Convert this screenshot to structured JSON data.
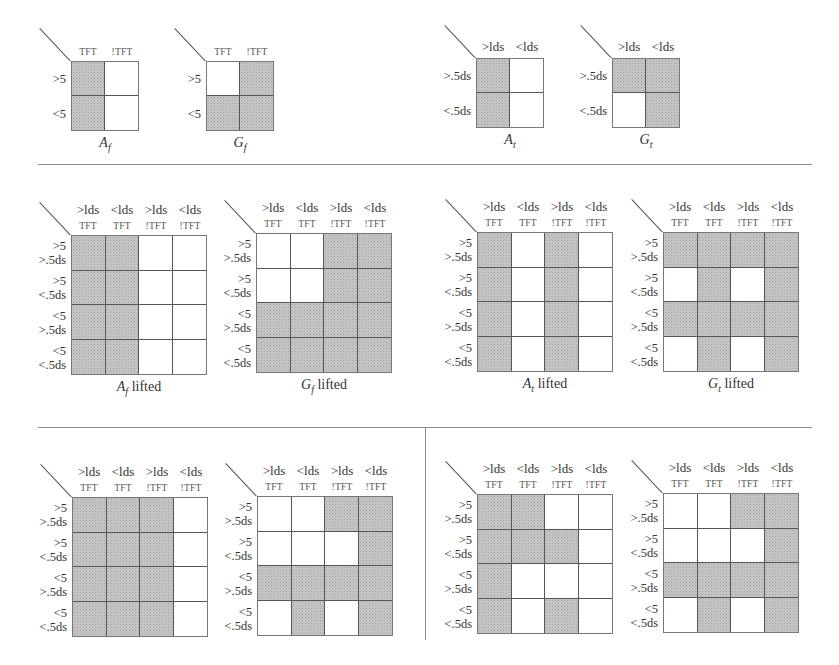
{
  "figure": {
    "dividers": {
      "top": "horizontal rule below small panels",
      "middle": "horizontal rule below lifted panels",
      "vertical": "vertical rule between bottom-left and bottom-right panel pairs"
    },
    "top_panels": [
      {
        "id": "A_f",
        "caption_main": "A",
        "caption_sub": "f",
        "caption_suffix": "",
        "col_headers_big": [],
        "col_headers_small": [
          "TFT",
          "!TFT"
        ],
        "row_headers": [
          [
            ">5"
          ],
          [
            "<5"
          ]
        ],
        "cells": [
          [
            1,
            0
          ],
          [
            1,
            0
          ]
        ]
      },
      {
        "id": "G_f",
        "caption_main": "G",
        "caption_sub": "f",
        "caption_suffix": "",
        "col_headers_big": [],
        "col_headers_small": [
          "TFT",
          "!TFT"
        ],
        "row_headers": [
          [
            ">5"
          ],
          [
            "<5"
          ]
        ],
        "cells": [
          [
            0,
            1
          ],
          [
            1,
            1
          ]
        ]
      },
      {
        "id": "A_t",
        "caption_main": "A",
        "caption_sub": "t",
        "caption_suffix": "",
        "col_headers_big": [
          ">lds",
          "<lds"
        ],
        "col_headers_small": [],
        "row_headers": [
          [
            ">.5ds"
          ],
          [
            "<.5ds"
          ]
        ],
        "cells": [
          [
            1,
            0
          ],
          [
            1,
            0
          ]
        ]
      },
      {
        "id": "G_t",
        "caption_main": "G",
        "caption_sub": "t",
        "caption_suffix": "",
        "col_headers_big": [
          ">lds",
          "<lds"
        ],
        "col_headers_small": [],
        "row_headers": [
          [
            ">.5ds"
          ],
          [
            "<.5ds"
          ]
        ],
        "cells": [
          [
            1,
            1
          ],
          [
            0,
            1
          ]
        ]
      }
    ],
    "lifted_col_headers_big": [
      ">lds",
      "<lds",
      ">lds",
      "<lds"
    ],
    "lifted_col_headers_small": [
      "TFT",
      "TFT",
      "!TFT",
      "!TFT"
    ],
    "lifted_row_headers": [
      [
        ">5",
        ">.5ds"
      ],
      [
        ">5",
        "<.5ds"
      ],
      [
        "<5",
        ">.5ds"
      ],
      [
        "<5",
        "<.5ds"
      ]
    ],
    "middle_panels": [
      {
        "id": "A_f_lifted",
        "caption_main": "A",
        "caption_sub": "f",
        "caption_suffix": " lifted",
        "cells": [
          [
            1,
            1,
            0,
            0
          ],
          [
            1,
            1,
            0,
            0
          ],
          [
            1,
            1,
            0,
            0
          ],
          [
            1,
            1,
            0,
            0
          ]
        ]
      },
      {
        "id": "G_f_lifted",
        "caption_main": "G",
        "caption_sub": "f",
        "caption_suffix": " lifted",
        "cells": [
          [
            0,
            0,
            1,
            1
          ],
          [
            0,
            0,
            1,
            1
          ],
          [
            1,
            1,
            1,
            1
          ],
          [
            1,
            1,
            1,
            1
          ]
        ]
      },
      {
        "id": "A_t_lifted",
        "caption_main": "A",
        "caption_sub": "t",
        "caption_suffix": " lifted",
        "cells": [
          [
            1,
            0,
            1,
            0
          ],
          [
            1,
            0,
            1,
            0
          ],
          [
            1,
            0,
            1,
            0
          ],
          [
            1,
            0,
            1,
            0
          ]
        ]
      },
      {
        "id": "G_t_lifted",
        "caption_main": "G",
        "caption_sub": "t",
        "caption_suffix": " lifted",
        "cells": [
          [
            1,
            1,
            1,
            1
          ],
          [
            0,
            1,
            0,
            1
          ],
          [
            1,
            1,
            1,
            1
          ],
          [
            0,
            1,
            0,
            1
          ]
        ]
      }
    ],
    "bottom_panels": [
      {
        "id": "union_A",
        "cells": [
          [
            1,
            1,
            1,
            0
          ],
          [
            1,
            1,
            1,
            0
          ],
          [
            1,
            1,
            1,
            0
          ],
          [
            1,
            1,
            1,
            0
          ]
        ]
      },
      {
        "id": "union_G",
        "cells": [
          [
            0,
            0,
            1,
            1
          ],
          [
            0,
            0,
            0,
            1
          ],
          [
            1,
            1,
            1,
            1
          ],
          [
            0,
            1,
            0,
            1
          ]
        ]
      },
      {
        "id": "intersection_A",
        "cells": [
          [
            1,
            1,
            0,
            0
          ],
          [
            1,
            1,
            1,
            0
          ],
          [
            1,
            0,
            0,
            0
          ],
          [
            1,
            0,
            1,
            0
          ]
        ]
      },
      {
        "id": "intersection_G",
        "cells": [
          [
            0,
            0,
            1,
            1
          ],
          [
            0,
            0,
            0,
            1
          ],
          [
            1,
            1,
            1,
            1
          ],
          [
            0,
            1,
            0,
            1
          ]
        ]
      }
    ],
    "colors": {
      "shaded": "#c2c2c2",
      "unshaded": "#ffffff",
      "grid_line": "#555555",
      "rule": "#8a8a8a"
    }
  }
}
